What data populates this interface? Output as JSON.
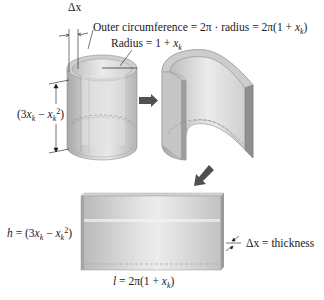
{
  "figure": {
    "labels": {
      "delta_x": "Δx",
      "outer_circumference_lhs": "Outer circumference = 2π · radius = 2π(1 + ",
      "radius_lhs": "Radius = 1 + ",
      "height_bracket_prefix": "(3",
      "height_bracket_mid": " − ",
      "h_prefix": "h",
      "h_eq": " = (3",
      "h_mid": " − ",
      "l_prefix": "l",
      "l_eq": " = 2π(1 + ",
      "thickness_text": " = thickness",
      "x_var": "x",
      "k_sub": "k",
      "exp2": "2",
      "close_paren": ")"
    },
    "panels": [
      {
        "name": "cylindrical-shell",
        "description": "Hollow cylinder with wall thickness Δx"
      },
      {
        "name": "cut-shell",
        "description": "Shell cut open"
      },
      {
        "name": "flattened-slab",
        "description": "Shell unrolled into a rectangular slab"
      }
    ],
    "colors": {
      "shell_light": "#e4e4e4",
      "shell_mid": "#c8c8c8",
      "shell_dark": "#9a9a9a",
      "arrow": "#505050",
      "ink": "#1a1a1a"
    }
  }
}
